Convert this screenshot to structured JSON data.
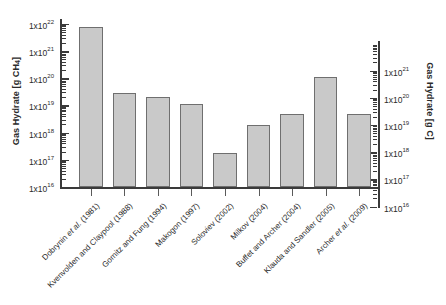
{
  "chart_data": {
    "type": "bar",
    "title": "",
    "xlabel": "",
    "ylabel": "Gas Hydrate [g CH4]",
    "ylabel_right": "Gas Hydrate [g C]",
    "yscale": "log",
    "ylim": [
      1e+16,
      1e+22
    ],
    "ylim_right": [
      1e+16,
      1e+21
    ],
    "grid": false,
    "legend": "none",
    "categories": [
      "Dobrynin et al. (1981)",
      "Kvenvolden and Claypool (1988)",
      "Gornitz and Fung (1994)",
      "Makogon (1997)",
      "Soloviev (2002)",
      "Milkov (2004)",
      "Buffet and Archer (2004)",
      "Klauda and Sandler (2005)",
      "Archer et al. (2009)"
    ],
    "values": [
      7.4e+21,
      2.9e+19,
      2.1e+19,
      1.15e+19,
      1.8e+17,
      1.9e+18,
      4.9e+18,
      1.1e+20,
      5e+18
    ],
    "value_labels": [
      "7.4x10^21",
      "2.9x10^19",
      "2.1x10^19",
      "1.15x10^19",
      "1.8x10^17",
      "1.9x10^18",
      "4.9x10^18",
      "1.1x10^20",
      "5.0x10^18"
    ],
    "bar_color": "#c9c9c9",
    "bar_edge_color": "#6f6f6f",
    "axis_color": "#3a3a3a",
    "yticks_left": [
      {
        "label": "1x10",
        "exp": "16",
        "value": 1e+16
      },
      {
        "label": "1x10",
        "exp": "17",
        "value": 1e+17
      },
      {
        "label": "1x10",
        "exp": "18",
        "value": 1e+18
      },
      {
        "label": "1x10",
        "exp": "19",
        "value": 1e+19
      },
      {
        "label": "1x10",
        "exp": "20",
        "value": 1e+20
      },
      {
        "label": "1x10",
        "exp": "21",
        "value": 1e+21
      },
      {
        "label": "1x10",
        "exp": "22",
        "value": 1e+22
      }
    ],
    "yticks_right": [
      {
        "label": "1x10",
        "exp": "16",
        "value": 1e+16
      },
      {
        "label": "1x10",
        "exp": "17",
        "value": 1e+17
      },
      {
        "label": "1x10",
        "exp": "18",
        "value": 1e+18
      },
      {
        "label": "1x10",
        "exp": "19",
        "value": 1e+19
      },
      {
        "label": "1x10",
        "exp": "20",
        "value": 1e+20
      },
      {
        "label": "1x10",
        "exp": "21",
        "value": 1e+21
      }
    ]
  }
}
